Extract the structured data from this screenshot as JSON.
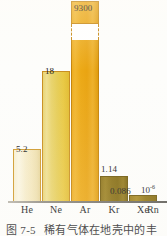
{
  "chart_data": {
    "type": "bar",
    "title": "",
    "xlabel": "",
    "ylabel": "",
    "categories": [
      "He",
      "Ne",
      "Ar",
      "Kr",
      "Xe",
      "Rn"
    ],
    "values": [
      5.2,
      18,
      9300,
      1.14,
      0.086,
      1e-06
    ],
    "value_labels": [
      "5.2",
      "18",
      "9300",
      "1.14",
      "0.086",
      "10⁻⁶"
    ],
    "grid": false,
    "legend": null,
    "axis_break": {
      "series": "Ar",
      "note": "broken bar — dashed gap near top of Ar column"
    },
    "units_note": "10⁻⁶",
    "bar_colors": [
      "#f6ecca",
      "#e9d46e",
      "#eca916",
      "#8a7014",
      "#8f7312",
      "#8f7312"
    ],
    "axis_color": "#6f6c66"
  },
  "labels": {
    "he_value": "5.2",
    "ne_value": "18",
    "ar_value": "9300",
    "kr_value": "1.14",
    "xe_value": "0.086",
    "exponent_base": "10",
    "exponent_power": "-6"
  },
  "ticks": {
    "he": "He",
    "ne": "Ne",
    "ar": "Ar",
    "kr": "Kr",
    "xe": "Xe",
    "rn": "Rn"
  },
  "caption": {
    "figure_number": "图 7-5",
    "text": "稀有气体在地壳中的丰"
  }
}
